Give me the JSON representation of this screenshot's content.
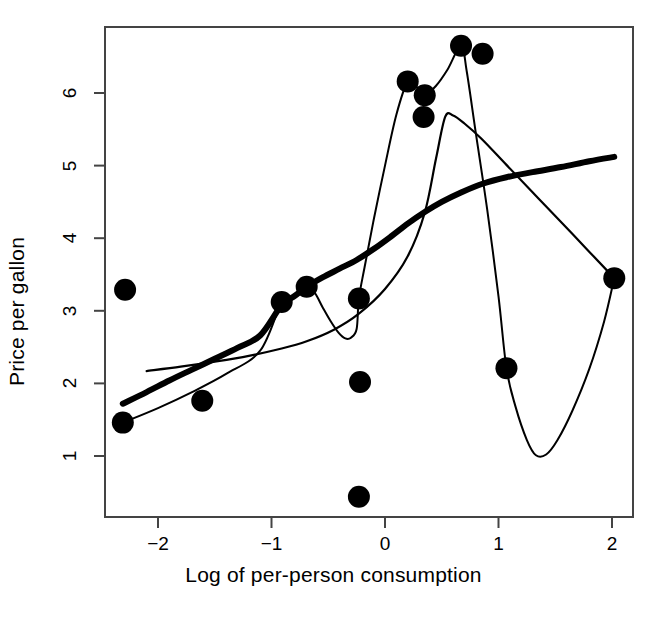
{
  "chart_data": {
    "type": "scatter",
    "title": "",
    "xlabel": "Log of per-person consumption",
    "ylabel": "Price per gallon",
    "xlim": [
      -2.46,
      2.19
    ],
    "ylim": [
      0.29,
      6.93
    ],
    "xticks": [
      -2,
      -1,
      0,
      1,
      2
    ],
    "xticklabels": [
      "−2",
      "−1",
      "0",
      "1",
      "2"
    ],
    "yticks": [
      1,
      2,
      3,
      4,
      5,
      6
    ],
    "yticklabels": [
      "1",
      "2",
      "3",
      "4",
      "5",
      "6"
    ],
    "grid": false,
    "legend": null,
    "points": [
      {
        "x": -2.29,
        "y": 3.29
      },
      {
        "x": -2.31,
        "y": 1.46
      },
      {
        "x": -1.61,
        "y": 1.76
      },
      {
        "x": -0.91,
        "y": 3.12
      },
      {
        "x": -0.69,
        "y": 3.33
      },
      {
        "x": -0.23,
        "y": 3.17
      },
      {
        "x": -0.22,
        "y": 2.02
      },
      {
        "x": -0.23,
        "y": 0.44
      },
      {
        "x": 0.2,
        "y": 6.16
      },
      {
        "x": 0.35,
        "y": 5.97
      },
      {
        "x": 0.34,
        "y": 5.67
      },
      {
        "x": 0.67,
        "y": 6.65
      },
      {
        "x": 0.86,
        "y": 6.54
      },
      {
        "x": 1.07,
        "y": 2.21
      },
      {
        "x": 2.02,
        "y": 3.45
      }
    ],
    "series": [
      {
        "name": "thick-smooth-fit",
        "style": "thick-line",
        "linewidth": 6,
        "color": "#000000",
        "points": [
          {
            "x": -2.31,
            "y": 1.72
          },
          {
            "x": -2.1,
            "y": 1.88
          },
          {
            "x": -1.9,
            "y": 2.04
          },
          {
            "x": -1.7,
            "y": 2.19
          },
          {
            "x": -1.5,
            "y": 2.34
          },
          {
            "x": -1.3,
            "y": 2.49
          },
          {
            "x": -1.1,
            "y": 2.66
          },
          {
            "x": -0.91,
            "y": 3.08
          },
          {
            "x": -0.8,
            "y": 3.2
          },
          {
            "x": -0.69,
            "y": 3.33
          },
          {
            "x": -0.55,
            "y": 3.46
          },
          {
            "x": -0.4,
            "y": 3.58
          },
          {
            "x": -0.25,
            "y": 3.7
          },
          {
            "x": -0.1,
            "y": 3.85
          },
          {
            "x": 0.05,
            "y": 4.02
          },
          {
            "x": 0.2,
            "y": 4.2
          },
          {
            "x": 0.35,
            "y": 4.36
          },
          {
            "x": 0.5,
            "y": 4.5
          },
          {
            "x": 0.67,
            "y": 4.63
          },
          {
            "x": 0.86,
            "y": 4.75
          },
          {
            "x": 1.07,
            "y": 4.84
          },
          {
            "x": 1.3,
            "y": 4.91
          },
          {
            "x": 1.55,
            "y": 4.98
          },
          {
            "x": 1.8,
            "y": 5.06
          },
          {
            "x": 2.02,
            "y": 5.12
          }
        ]
      },
      {
        "name": "thin-smooth-fit",
        "style": "thin-line",
        "linewidth": 2.2,
        "color": "#000000",
        "points": [
          {
            "x": -2.1,
            "y": 2.17
          },
          {
            "x": -1.8,
            "y": 2.23
          },
          {
            "x": -1.5,
            "y": 2.3
          },
          {
            "x": -1.2,
            "y": 2.38
          },
          {
            "x": -0.91,
            "y": 2.48
          },
          {
            "x": -0.69,
            "y": 2.58
          },
          {
            "x": -0.45,
            "y": 2.74
          },
          {
            "x": -0.23,
            "y": 2.96
          },
          {
            "x": 0.0,
            "y": 3.3
          },
          {
            "x": 0.2,
            "y": 3.75
          },
          {
            "x": 0.35,
            "y": 4.35
          },
          {
            "x": 0.45,
            "y": 5.1
          },
          {
            "x": 0.53,
            "y": 5.67
          },
          {
            "x": 0.6,
            "y": 5.69
          },
          {
            "x": 0.7,
            "y": 5.58
          },
          {
            "x": 0.85,
            "y": 5.37
          },
          {
            "x": 1.07,
            "y": 5.01
          },
          {
            "x": 1.35,
            "y": 4.55
          },
          {
            "x": 1.65,
            "y": 4.06
          },
          {
            "x": 2.02,
            "y": 3.45
          }
        ]
      },
      {
        "name": "thin-wiggly-interpolant",
        "style": "thin-line",
        "linewidth": 2.0,
        "color": "#000000",
        "points": [
          {
            "x": -2.31,
            "y": 1.46
          },
          {
            "x": -2.0,
            "y": 1.66
          },
          {
            "x": -1.7,
            "y": 1.88
          },
          {
            "x": -1.4,
            "y": 2.13
          },
          {
            "x": -1.1,
            "y": 2.45
          },
          {
            "x": -0.91,
            "y": 3.12
          },
          {
            "x": -0.82,
            "y": 3.2
          },
          {
            "x": -0.69,
            "y": 3.33
          },
          {
            "x": -0.62,
            "y": 3.25
          },
          {
            "x": -0.55,
            "y": 3.05
          },
          {
            "x": -0.48,
            "y": 2.86
          },
          {
            "x": -0.41,
            "y": 2.7
          },
          {
            "x": -0.35,
            "y": 2.62
          },
          {
            "x": -0.3,
            "y": 2.63
          },
          {
            "x": -0.25,
            "y": 2.75
          },
          {
            "x": -0.23,
            "y": 3.17
          },
          {
            "x": -0.18,
            "y": 3.6
          },
          {
            "x": -0.1,
            "y": 4.25
          },
          {
            "x": 0.0,
            "y": 5.0
          },
          {
            "x": 0.1,
            "y": 5.7
          },
          {
            "x": 0.2,
            "y": 6.16
          },
          {
            "x": 0.26,
            "y": 6.12
          },
          {
            "x": 0.31,
            "y": 6.02
          },
          {
            "x": 0.35,
            "y": 5.97
          },
          {
            "x": 0.45,
            "y": 6.1
          },
          {
            "x": 0.55,
            "y": 6.32
          },
          {
            "x": 0.67,
            "y": 6.65
          },
          {
            "x": 0.72,
            "y": 6.3
          },
          {
            "x": 0.8,
            "y": 5.45
          },
          {
            "x": 0.9,
            "y": 4.4
          },
          {
            "x": 1.0,
            "y": 3.2
          },
          {
            "x": 1.07,
            "y": 2.21
          },
          {
            "x": 1.15,
            "y": 1.68
          },
          {
            "x": 1.25,
            "y": 1.22
          },
          {
            "x": 1.33,
            "y": 1.01
          },
          {
            "x": 1.42,
            "y": 1.02
          },
          {
            "x": 1.52,
            "y": 1.22
          },
          {
            "x": 1.65,
            "y": 1.62
          },
          {
            "x": 1.8,
            "y": 2.2
          },
          {
            "x": 1.93,
            "y": 2.85
          },
          {
            "x": 2.02,
            "y": 3.45
          }
        ]
      }
    ],
    "marker": {
      "shape": "filled-circle",
      "radius_px": 11,
      "color": "#000000"
    },
    "axes": {
      "frame": true,
      "frame_color": "#444444",
      "frame_width": 2
    }
  }
}
